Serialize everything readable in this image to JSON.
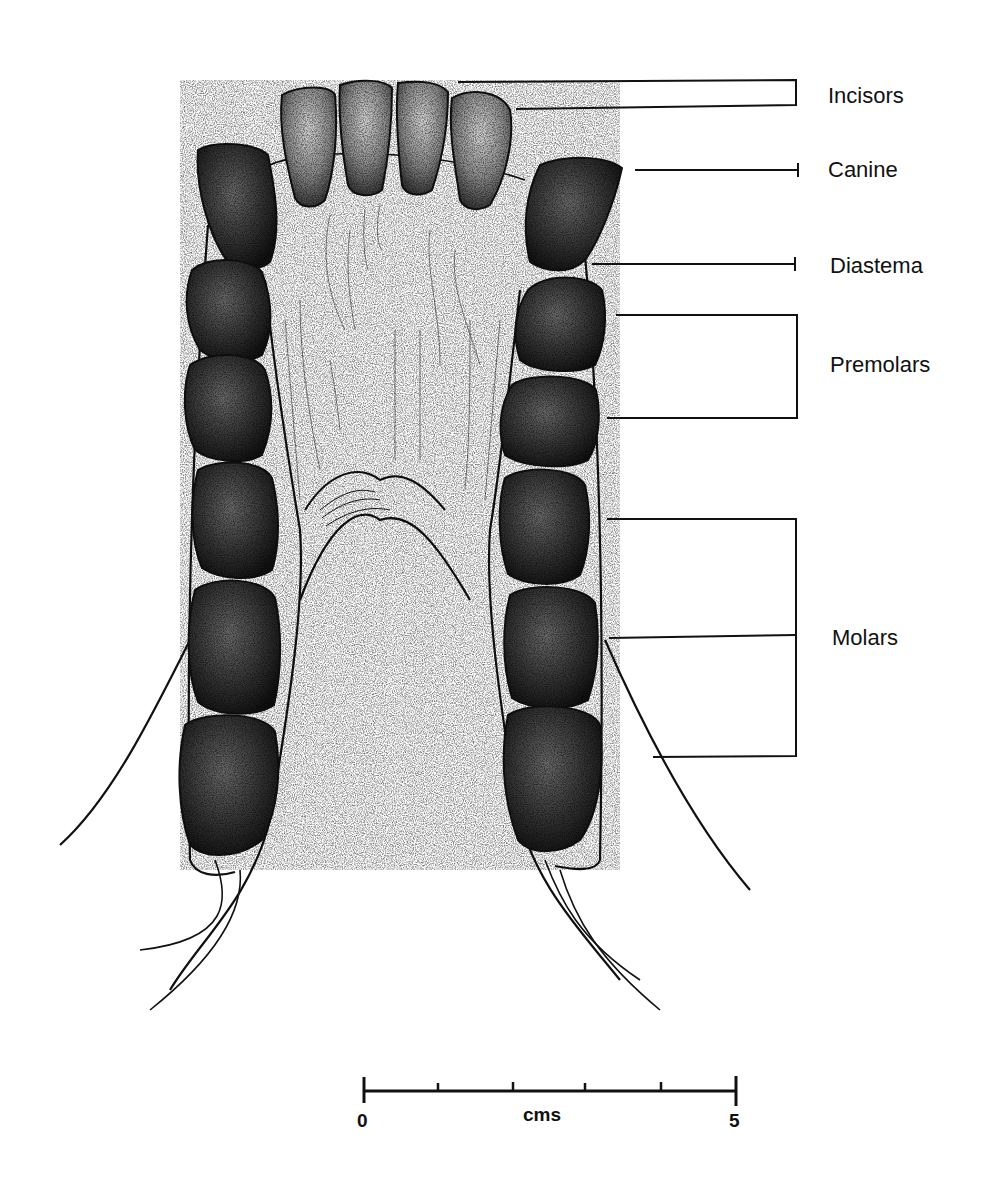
{
  "diagram": {
    "labels": [
      {
        "id": "incisors",
        "text": "Incisors"
      },
      {
        "id": "canine",
        "text": "Canine"
      },
      {
        "id": "diastema",
        "text": "Diastema"
      },
      {
        "id": "premolars",
        "text": "Premolars"
      },
      {
        "id": "molars",
        "text": "Molars"
      }
    ],
    "scale_bar": {
      "start_label": "0",
      "end_label": "5",
      "unit_label": "cms",
      "ticks": 6
    },
    "colors": {
      "ink": "#111111",
      "tooth_fill": "#3a3a3a",
      "incisor_fill": "#8a8a8a",
      "background": "#ffffff"
    }
  }
}
